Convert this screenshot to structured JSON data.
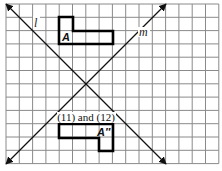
{
  "diagram": {
    "grid": {
      "columns": 16,
      "rows": 12,
      "origin_x": 6,
      "origin_y": 4,
      "cell": 13.3
    },
    "lines": [
      {
        "name": "l",
        "label": "l"
      },
      {
        "name": "m",
        "label": "m"
      }
    ],
    "figures": [
      {
        "name": "A",
        "label": "A"
      },
      {
        "name": "A-double-prime",
        "label": "A″"
      }
    ],
    "caption": "(11) and (12)",
    "colors": {
      "grid": "#8a8a8a",
      "figure": "#000000",
      "line": "#111111"
    }
  }
}
